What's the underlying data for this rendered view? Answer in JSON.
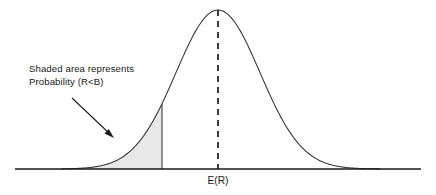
{
  "figure": {
    "background_color": "#ffffff",
    "curve_color": "#3a3a3a",
    "shade_color": "#e8e8e8",
    "axis_color": "#1a1a1a",
    "text_color": "#1a1a1a"
  },
  "annotation": {
    "line1": "Shaded area represents",
    "line2": "Probability (R<B)"
  },
  "axis": {
    "mean_label": "E(R)"
  },
  "chart_data": {
    "type": "area",
    "xlabel": "",
    "ylabel": "",
    "grid": false,
    "legend": null,
    "distribution": "normal",
    "mean_x": 218,
    "std_dev_px": 42,
    "peak_y": 10,
    "baseline_y": 169,
    "axis_x_start": 15,
    "axis_x_end": 421,
    "curve_x_start": 62,
    "curve_x_end": 380,
    "shade_boundary_x": 162,
    "shade_boundary_curve_y": 76,
    "annotations": [
      {
        "text": "Shaded area represents Probability (R<B)",
        "text_x": 29,
        "text_y": 64,
        "arrow_from": [
          72,
          98
        ],
        "arrow_to": [
          113,
          137
        ]
      },
      {
        "text": "E(R)",
        "x": 218,
        "y": 183,
        "marks": "mean / expected value tick on horizontal axis"
      }
    ],
    "series": [
      {
        "name": "probability density",
        "x": [
          62,
          72,
          82,
          92,
          102,
          112,
          122,
          132,
          142,
          152,
          162,
          172,
          182,
          192,
          202,
          212,
          218,
          224,
          234,
          244,
          254,
          264,
          274,
          284,
          294,
          304,
          314,
          324,
          334,
          344,
          354,
          364,
          374,
          380
        ],
        "y": [
          169,
          168,
          166,
          163,
          159,
          153,
          145,
          135,
          122,
          105,
          86,
          67,
          49,
          33,
          21,
          12,
          10,
          12,
          21,
          33,
          49,
          67,
          86,
          105,
          122,
          135,
          145,
          153,
          159,
          163,
          166,
          168,
          169,
          169
        ]
      }
    ],
    "shaded_region": {
      "label": "Probability (R<B)",
      "x_from": 62,
      "x_to": 162,
      "fill": "#e8e8e8"
    }
  }
}
